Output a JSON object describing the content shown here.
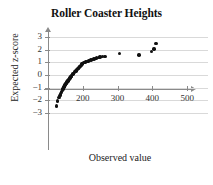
{
  "chart_data": {
    "type": "scatter",
    "title": "Roller Coaster Heights",
    "xlabel": "Observed value",
    "ylabel": "Expected z-score",
    "xlim": [
      100,
      560
    ],
    "ylim": [
      -3.4,
      3.4
    ],
    "xticks": [
      200,
      300,
      400,
      500
    ],
    "yticks": [
      3,
      2,
      1,
      0,
      -1,
      -2,
      -3
    ],
    "ytick_labels": [
      "3",
      "2",
      "1",
      "0",
      "−1",
      "−2",
      "−3"
    ],
    "xtick_labels": [
      "200",
      "300",
      "400",
      "500"
    ],
    "grid": "horizontal",
    "legend": "none",
    "series": [
      {
        "name": "Roller coaster heights",
        "x": [
          125,
          128,
          132,
          134,
          136,
          138,
          139,
          141,
          142,
          143,
          144,
          145,
          146,
          147,
          148,
          149,
          150,
          151,
          152,
          153,
          154,
          155,
          156,
          157,
          158,
          159,
          160,
          161,
          162,
          163,
          164,
          165,
          166,
          167,
          168,
          170,
          172,
          174,
          176,
          178,
          180,
          182,
          184,
          186,
          188,
          190,
          192,
          194,
          196,
          198,
          200,
          202,
          205,
          208,
          212,
          216,
          220,
          224,
          228,
          232,
          236,
          240,
          245,
          250,
          256,
          262,
          266,
          305,
          362,
          398,
          405,
          410
        ],
        "y": [
          -2.45,
          -2.05,
          -1.78,
          -1.62,
          -1.5,
          -1.4,
          -1.32,
          -1.24,
          -1.17,
          -1.11,
          -1.05,
          -0.99,
          -0.94,
          -0.89,
          -0.84,
          -0.79,
          -0.75,
          -0.7,
          -0.66,
          -0.62,
          -0.58,
          -0.54,
          -0.5,
          -0.46,
          -0.42,
          -0.38,
          -0.34,
          -0.3,
          -0.27,
          -0.23,
          -0.19,
          -0.16,
          -0.12,
          -0.08,
          -0.05,
          0.02,
          0.08,
          0.14,
          0.2,
          0.26,
          0.32,
          0.38,
          0.44,
          0.5,
          0.56,
          0.62,
          0.68,
          0.74,
          0.8,
          0.86,
          0.92,
          0.97,
          1.0,
          1.03,
          1.06,
          1.1,
          1.14,
          1.18,
          1.22,
          1.26,
          1.3,
          1.34,
          1.38,
          1.42,
          1.44,
          1.45,
          1.46,
          1.7,
          1.58,
          1.88,
          2.05,
          2.48
        ]
      }
    ]
  },
  "colors": {
    "point": "#111111",
    "axis": "#8a8a8a",
    "grid": "#d9d9d9",
    "text": "#222222",
    "background": "#ffffff"
  }
}
